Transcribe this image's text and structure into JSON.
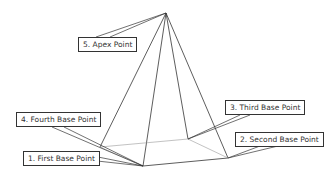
{
  "diagram": {
    "points": {
      "apex": {
        "x": 166,
        "y": 13
      },
      "first": {
        "x": 143,
        "y": 166
      },
      "second": {
        "x": 228,
        "y": 158
      },
      "third": {
        "x": 188,
        "y": 139
      },
      "fourth": {
        "x": 100,
        "y": 147
      }
    },
    "labels": [
      {
        "id": "apex",
        "text": "5. Apex Point"
      },
      {
        "id": "fourth",
        "text": "4. Fourth Base Point"
      },
      {
        "id": "first",
        "text": "1. First Base Point"
      },
      {
        "id": "third",
        "text": "3. Third Base Point"
      },
      {
        "id": "second",
        "text": "2. Second Base Point"
      }
    ],
    "colors": {
      "edge": "#333333",
      "hidden_edge": "#999999",
      "label_border": "#333333"
    }
  }
}
